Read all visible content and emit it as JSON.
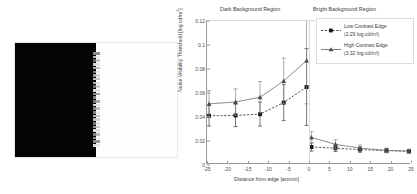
{
  "figure": {
    "stimulus": {
      "name": "edge-stimulus-image",
      "dark_side_label": "dark half",
      "bright_side_label": "bright half",
      "noise_patch_count": 26
    }
  },
  "chart_data": {
    "type": "line",
    "title": "",
    "xlabel": "Distance from edge [arcmin]",
    "ylabel": "Noise Visibility Threshold [log cd/m²]",
    "xlim": [
      -25,
      25
    ],
    "ylim": [
      0,
      0.12
    ],
    "xticks": [
      -25,
      -20,
      -15,
      -10,
      -5,
      0,
      5,
      10,
      15,
      20,
      25
    ],
    "xtick_labels": [
      "-25",
      "-20",
      "-15",
      "-10",
      "-5",
      "0",
      "5",
      "10",
      "15",
      "20",
      "25"
    ],
    "yticks": [
      0,
      0.02,
      0.04,
      0.06,
      0.08,
      0.1,
      0.12
    ],
    "ytick_labels": [
      "0",
      "0.02",
      "0.04",
      "0.06",
      "0.08",
      "0.1",
      "0.12"
    ],
    "grid": false,
    "legend_position": "top-right",
    "region_labels": {
      "left": "Dark Background Region",
      "right": "Bright Background Region"
    },
    "series": [
      {
        "name": "Low Contrast Edge",
        "detail": "(2.29 log cd/m²)",
        "marker": "filled-square",
        "linestyle": "dashed",
        "color": "#2a2a2a",
        "x": [
          -24.5,
          -18,
          -12,
          -6.2,
          -0.6,
          0.6,
          6.5,
          12.5,
          19,
          24.5
        ],
        "y": [
          0.041,
          0.0413,
          0.0424,
          0.052,
          0.065,
          0.015,
          0.014,
          0.0128,
          0.012,
          0.0115
        ],
        "yerr_low": [
          0.0085,
          0.0093,
          0.01,
          0.015,
          0.032,
          0.0035,
          0.0028,
          0.0022,
          0.0018,
          0.0015
        ],
        "yerr_high": [
          0.0085,
          0.0093,
          0.01,
          0.015,
          0.032,
          0.0035,
          0.0028,
          0.0022,
          0.0018,
          0.0015
        ]
      },
      {
        "name": "High Contrast Edge",
        "detail": "(3.32 log cd/m²)",
        "marker": "filled-triangle",
        "linestyle": "solid",
        "color": "#6f6f6f",
        "x": [
          -24.5,
          -18,
          -12,
          -6.2,
          -0.6,
          0.6,
          6.5,
          12.5,
          19,
          24.5
        ],
        "y": [
          0.051,
          0.0525,
          0.0565,
          0.07,
          0.087,
          0.023,
          0.0172,
          0.014,
          0.0122,
          0.0115
        ],
        "yerr_low": [
          0.011,
          0.011,
          0.013,
          0.019,
          0.036,
          0.0048,
          0.0038,
          0.0026,
          0.0018,
          0.0015
        ],
        "yerr_high": [
          0.011,
          0.011,
          0.013,
          0.019,
          0.036,
          0.0048,
          0.0038,
          0.0026,
          0.0018,
          0.0015
        ]
      }
    ]
  }
}
